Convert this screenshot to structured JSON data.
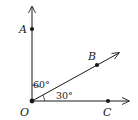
{
  "diagram": {
    "type": "angle-rays",
    "vertex": {
      "label": "O",
      "x": 32,
      "y": 101
    },
    "rays": [
      {
        "id": "OA",
        "end": {
          "x": 32,
          "y": 6
        },
        "point": {
          "label": "A",
          "x": 32,
          "y": 29
        }
      },
      {
        "id": "OB",
        "end": {
          "x": 119,
          "y": 53
        },
        "point": {
          "label": "B",
          "x": 97,
          "y": 65
        }
      },
      {
        "id": "OC",
        "end": {
          "x": 129,
          "y": 101
        },
        "point": {
          "label": "C",
          "x": 108,
          "y": 101
        }
      }
    ],
    "angles": [
      {
        "between": "AOB",
        "label": "60°"
      },
      {
        "between": "BOC",
        "label": "30°"
      }
    ],
    "colors": {
      "stroke": "#1a1a1a",
      "background": "#ffffff"
    }
  }
}
